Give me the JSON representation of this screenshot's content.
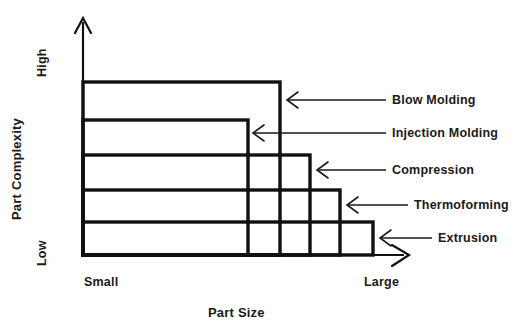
{
  "diagram": {
    "axes": {
      "y": {
        "title": "Part Complexity",
        "high_label": "High",
        "low_label": "Low"
      },
      "x": {
        "title": "Part Size",
        "small_label": "Small",
        "large_label": "Large"
      }
    },
    "colors": {
      "ink": "#1a1a1a",
      "line": "#111111",
      "background": "#ffffff"
    },
    "regions": [
      {
        "label": "Blow Molding",
        "complexity_rank": 5,
        "size_rank": 2,
        "right_edge_x": 280,
        "top_edge_y": 82
      },
      {
        "label": "Injection Molding",
        "complexity_rank": 4,
        "size_rank": 1,
        "right_edge_x": 248,
        "top_edge_y": 120
      },
      {
        "label": "Compression",
        "complexity_rank": 3,
        "size_rank": 3,
        "right_edge_x": 310,
        "top_edge_y": 155
      },
      {
        "label": "Thermoforming",
        "complexity_rank": 2,
        "size_rank": 4,
        "right_edge_x": 340,
        "top_edge_y": 190
      },
      {
        "label": "Extrusion",
        "complexity_rank": 1,
        "size_rank": 5,
        "right_edge_x": 373,
        "top_edge_y": 222
      }
    ]
  }
}
